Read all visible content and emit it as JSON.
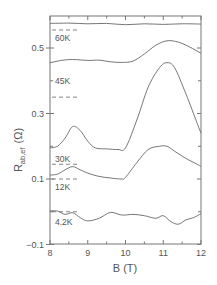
{
  "chart_data": {
    "type": "line",
    "title": "",
    "xlabel": "B (T)",
    "ylabel": "R_ab,ef (Ω)",
    "ylabel_main": "R",
    "ylabel_sub": "ab,ef",
    "ylabel_unit": "(Ω)",
    "xlim": [
      8,
      12
    ],
    "ylim": [
      -0.1,
      0.6
    ],
    "xticks": [
      8,
      9,
      10,
      11,
      12
    ],
    "xtick_labels": [
      "8",
      "9",
      "10",
      "11",
      "12"
    ],
    "yticks": [
      -0.1,
      0.1,
      0.3,
      0.5
    ],
    "ytick_labels": [
      "-0.1",
      "0.1",
      "0.3",
      "0.5"
    ],
    "grid": false,
    "legend": "inline labels",
    "series": [
      {
        "name": "60K",
        "baseline": 0.555,
        "x": [
          8.0,
          8.5,
          9.0,
          9.5,
          10.0,
          10.5,
          11.0,
          11.5,
          12.0
        ],
        "y": [
          0.575,
          0.576,
          0.574,
          0.575,
          0.571,
          0.574,
          0.572,
          0.574,
          0.573
        ]
      },
      {
        "name": "45K",
        "baseline": 0.35,
        "x": [
          8.0,
          8.3,
          8.6,
          9.0,
          9.3,
          9.6,
          9.9,
          10.2,
          10.5,
          10.8,
          11.1,
          11.4,
          11.7,
          12.0
        ],
        "y": [
          0.455,
          0.462,
          0.465,
          0.462,
          0.463,
          0.458,
          0.456,
          0.46,
          0.482,
          0.508,
          0.522,
          0.518,
          0.503,
          0.484
        ]
      },
      {
        "name": "30K",
        "baseline": 0.145,
        "x": [
          8.0,
          8.2,
          8.4,
          8.6,
          8.8,
          9.0,
          9.2,
          9.5,
          9.8,
          10.0,
          10.3,
          10.6,
          10.9,
          11.1,
          11.3,
          11.6,
          11.9,
          12.0
        ],
        "y": [
          0.195,
          0.2,
          0.225,
          0.26,
          0.248,
          0.215,
          0.195,
          0.192,
          0.19,
          0.195,
          0.28,
          0.38,
          0.44,
          0.455,
          0.44,
          0.36,
          0.27,
          0.24
        ]
      },
      {
        "name": "12K",
        "baseline": 0.1,
        "x": [
          8.0,
          8.2,
          8.4,
          8.6,
          8.8,
          9.0,
          9.3,
          9.6,
          9.9,
          10.0,
          10.3,
          10.6,
          10.9,
          11.1,
          11.3,
          11.6,
          11.9,
          12.0
        ],
        "y": [
          0.112,
          0.115,
          0.128,
          0.138,
          0.128,
          0.118,
          0.108,
          0.103,
          0.1,
          0.105,
          0.15,
          0.19,
          0.2,
          0.2,
          0.185,
          0.163,
          0.145,
          0.138
        ]
      },
      {
        "name": "4.2K",
        "baseline": 0.0,
        "x": [
          8.0,
          8.2,
          8.4,
          8.6,
          8.8,
          9.0,
          9.3,
          9.6,
          9.9,
          10.2,
          10.5,
          10.8,
          11.0,
          11.2,
          11.4,
          11.6,
          11.8,
          12.0
        ],
        "y": [
          0.003,
          0.002,
          -0.008,
          -0.003,
          -0.018,
          -0.028,
          -0.02,
          -0.002,
          -0.01,
          -0.008,
          -0.012,
          -0.02,
          -0.012,
          -0.03,
          -0.038,
          -0.025,
          -0.018,
          -0.006
        ]
      }
    ],
    "annotations": [
      "60K",
      "45K",
      "30K",
      "12K",
      "4.2K"
    ]
  }
}
